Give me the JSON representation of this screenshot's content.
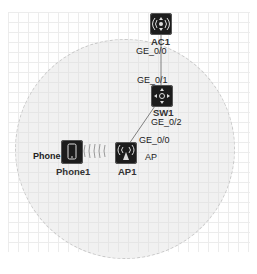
{
  "diagram": {
    "type": "network-topology",
    "colors": {
      "device_bg": "#1c1c1c",
      "link": "#808080",
      "coverage": "#e1e1e1",
      "grid": "#ececec"
    },
    "devices": [
      {
        "id": "ac1",
        "name": "AC1",
        "icon": "access-controller-icon"
      },
      {
        "id": "sw1",
        "name": "SW1",
        "icon": "switch-icon"
      },
      {
        "id": "ap1",
        "name": "AP1",
        "icon": "access-point-icon",
        "role_label": "AP"
      },
      {
        "id": "phone1",
        "name": "Phone1",
        "icon": "phone-icon",
        "role_label": "Phone"
      }
    ],
    "links": [
      {
        "from": "AC1",
        "from_port": "GE_0/0",
        "to": "SW1",
        "to_port": "GE_0/1",
        "type": "wired"
      },
      {
        "from": "SW1",
        "from_port": "GE_0/2",
        "to": "AP1",
        "to_port": "GE_0/0",
        "type": "wired"
      },
      {
        "from": "AP1",
        "to": "Phone1",
        "type": "wireless"
      }
    ],
    "ports": {
      "ac1_ge00": "GE_0/0",
      "sw1_ge01": "GE_0/1",
      "sw1_ge02": "GE_0/2",
      "ap1_ge00": "GE_0/0"
    },
    "coverage_area": "AP1 wireless coverage"
  }
}
